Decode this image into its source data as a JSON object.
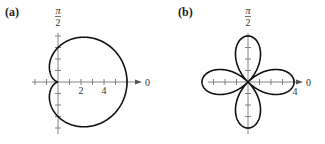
{
  "chart_data": [
    {
      "type": "line",
      "coordinate_system": "polar",
      "panel_label": "(a)",
      "equation": "r = 3 + 3cos θ",
      "curve_name": "cardioid",
      "theta_range": [
        0,
        6.283185307
      ],
      "r_coefficients": {
        "a": 3,
        "b": 3,
        "func": "cos",
        "n": 1
      },
      "x_range": [
        -3,
        6
      ],
      "y_range": [
        -4,
        4
      ],
      "x_tick_step": 1,
      "y_tick_step": 1,
      "x_tick_labels": [
        {
          "value": 2,
          "text": "2"
        },
        {
          "value": 4,
          "text": "4"
        }
      ],
      "polar_axis_label": "0",
      "vertical_axis_label": {
        "numerator": "π",
        "denominator": "2"
      },
      "grid": false,
      "legend": "none"
    },
    {
      "type": "line",
      "coordinate_system": "polar",
      "panel_label": "(b)",
      "equation": "r = 4cos 2θ",
      "curve_name": "rose (4 petals)",
      "theta_range": [
        0,
        6.283185307
      ],
      "r_coefficients": {
        "a": 0,
        "b": 4,
        "func": "cos",
        "n": 2
      },
      "x_range": [
        -4,
        4
      ],
      "y_range": [
        -4,
        4
      ],
      "x_tick_step": 1,
      "y_tick_step": 1,
      "x_tick_labels": [
        {
          "value": 4,
          "text": "4"
        }
      ],
      "polar_axis_label": "0",
      "vertical_axis_label": {
        "numerator": "π",
        "denominator": "2"
      },
      "grid": false,
      "legend": "none"
    }
  ]
}
